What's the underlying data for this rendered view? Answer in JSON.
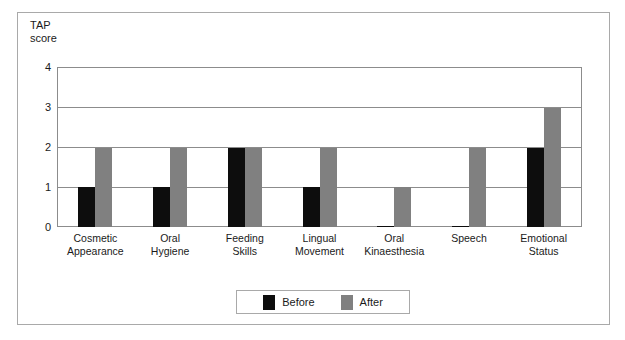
{
  "chart_data": {
    "type": "bar",
    "title": "",
    "subtitle": "",
    "xlabel": "",
    "ylabel": "TAP\nscore",
    "ylim": [
      0,
      4
    ],
    "yticks": [
      "0",
      "1",
      "2",
      "3",
      "4"
    ],
    "grid": true,
    "grid_axis": "y",
    "legend_position": "bottom-center",
    "categories": [
      "Cosmetic\nAppearance",
      "Oral\nHygiene",
      "Feeding\nSkills",
      "Lingual\nMovement",
      "Oral\nKinaesthesia",
      "Speech",
      "Emotional\nStatus"
    ],
    "series": [
      {
        "name": "Before",
        "color": "#0d0d0d",
        "values": [
          1,
          1,
          2,
          1,
          0,
          0,
          2
        ]
      },
      {
        "name": "After",
        "color": "#808080",
        "values": [
          2,
          2,
          2,
          2,
          1,
          2,
          3
        ]
      }
    ]
  },
  "legend": {
    "items": [
      {
        "label": "Before",
        "color": "#0d0d0d"
      },
      {
        "label": "After",
        "color": "#808080"
      }
    ]
  },
  "colors": {
    "before": "#0d0d0d",
    "after": "#808080",
    "frame": "#a9a9a9",
    "axis": "#8c8c8c",
    "text": "#1a1a1a",
    "background": "#ffffff"
  }
}
